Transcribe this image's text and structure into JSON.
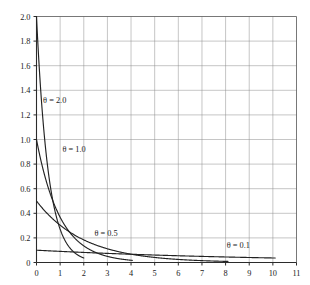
{
  "chart_data": {
    "type": "line",
    "title": "",
    "subtitle": "",
    "xlabel": "",
    "ylabel": "",
    "xlim": [
      0,
      11
    ],
    "ylim": [
      0,
      2.0
    ],
    "grid": true,
    "legend_position": "inline-annotations",
    "xticks": [
      "0",
      "1",
      "2",
      "3",
      "4",
      "5",
      "6",
      "7",
      "8",
      "9",
      "10",
      "11"
    ],
    "xtick_values": [
      0,
      1,
      2,
      3,
      4,
      5,
      6,
      7,
      8,
      9,
      10,
      11
    ],
    "yticks": [
      "0",
      "0.2",
      "0.4",
      "0.6",
      "0.8",
      "1.0",
      "1.2",
      "1.4",
      "1.6",
      "1.8",
      "2.0"
    ],
    "ytick_values": [
      0,
      0.2,
      0.4,
      0.6,
      0.8,
      1.0,
      1.2,
      1.4,
      1.6,
      1.8,
      2.0
    ],
    "function": "f(x) = theta * exp(-theta * x)",
    "series": [
      {
        "name": "theta = 2.0",
        "label": "θ = 2.0",
        "theta": 2.0,
        "color": "#222222",
        "x_start": 0,
        "x_end": 2.0,
        "x": [
          0,
          0.1,
          0.2,
          0.3,
          0.4,
          0.5,
          0.6,
          0.7,
          0.8,
          0.9,
          1.0,
          1.2,
          1.4,
          1.6,
          1.8,
          2.0
        ],
        "values": [
          2.0,
          1.637,
          1.341,
          1.098,
          0.899,
          0.736,
          0.602,
          0.493,
          0.404,
          0.331,
          0.271,
          0.181,
          0.122,
          0.082,
          0.055,
          0.037
        ]
      },
      {
        "name": "theta = 1.0",
        "label": "θ = 1.0",
        "theta": 1.0,
        "color": "#222222",
        "x_start": 0,
        "x_end": 4.05,
        "x": [
          0,
          0.2,
          0.4,
          0.6,
          0.8,
          1.0,
          1.25,
          1.5,
          1.75,
          2.0,
          2.5,
          3.0,
          3.5,
          4.0
        ],
        "values": [
          1.0,
          0.819,
          0.67,
          0.549,
          0.449,
          0.368,
          0.287,
          0.223,
          0.174,
          0.135,
          0.082,
          0.05,
          0.03,
          0.018
        ]
      },
      {
        "name": "theta = 0.5",
        "label": "θ = 0.5",
        "theta": 0.5,
        "color": "#222222",
        "x_start": 0,
        "x_end": 8.1,
        "x": [
          0,
          0.5,
          1.0,
          1.5,
          2.0,
          2.5,
          3.0,
          3.5,
          4.0,
          5.0,
          6.0,
          7.0,
          8.0
        ],
        "values": [
          0.5,
          0.389,
          0.303,
          0.236,
          0.184,
          0.143,
          0.112,
          0.087,
          0.068,
          0.041,
          0.025,
          0.015,
          0.009
        ]
      },
      {
        "name": "theta = 0.1",
        "label": "θ = 0.1",
        "theta": 0.1,
        "color": "#222222",
        "x_start": 0,
        "x_end": 10.1,
        "x": [
          0,
          1,
          2,
          3,
          4,
          5,
          6,
          7,
          8,
          9,
          10
        ],
        "values": [
          0.1,
          0.0905,
          0.0819,
          0.0741,
          0.067,
          0.0607,
          0.0549,
          0.0497,
          0.0449,
          0.0407,
          0.0368
        ]
      }
    ],
    "annotations": [
      {
        "text": "θ = 2.0",
        "x": 0.28,
        "y": 1.3
      },
      {
        "text": "θ = 1.0",
        "x": 1.1,
        "y": 0.9
      },
      {
        "text": "θ = 0.5",
        "x": 2.45,
        "y": 0.215
      },
      {
        "text": "θ = 0.1",
        "x": 8.05,
        "y": 0.115
      }
    ]
  }
}
